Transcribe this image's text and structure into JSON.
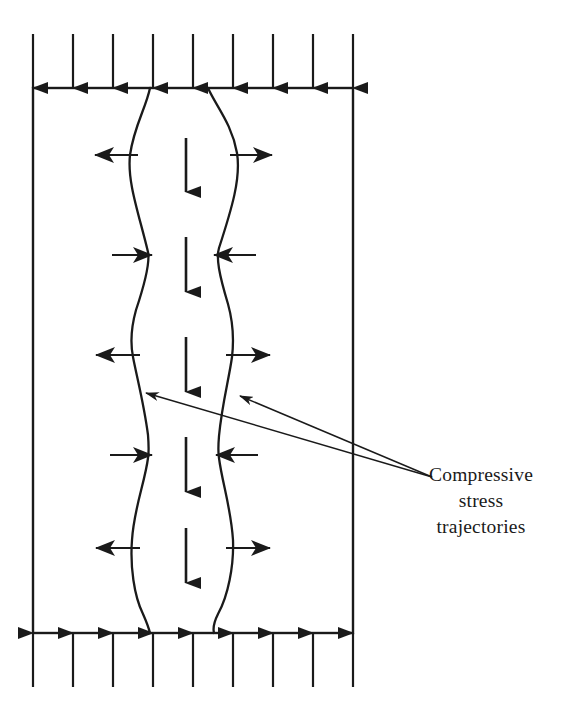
{
  "figure": {
    "background_color": "#ffffff",
    "line_color": "#1a1a1a",
    "text_color": "#1a1a1a"
  },
  "annotation": {
    "label": "Compressive\nstress\ntrajectories",
    "line1": "Compressive",
    "line2": "stress",
    "line3": "trajectories",
    "leader_count": 2
  },
  "specimen": {
    "name": "rectangular-specimen",
    "left": 33,
    "right": 353,
    "top": 88,
    "bottom": 633,
    "stroke_width": 2.4
  },
  "loads": {
    "top": {
      "name": "top-compressive-load",
      "direction": "down",
      "count": 9,
      "x_positions": [
        33,
        73,
        113,
        153,
        193,
        233,
        273,
        313,
        353
      ],
      "tail_y": 34,
      "head_y": 88
    },
    "bottom": {
      "name": "bottom-reaction-load",
      "direction": "up",
      "count": 9,
      "x_positions": [
        33,
        73,
        113,
        153,
        193,
        233,
        273,
        313,
        353
      ],
      "tail_y": 687,
      "head_y": 633
    }
  },
  "center_arrows": {
    "name": "axial-compression-arrows",
    "direction": "down",
    "count": 5,
    "x": 186,
    "items": [
      {
        "tail_y": 138,
        "head_y": 192
      },
      {
        "tail_y": 237,
        "head_y": 292
      },
      {
        "tail_y": 337,
        "head_y": 392
      },
      {
        "tail_y": 437,
        "head_y": 492
      },
      {
        "tail_y": 528,
        "head_y": 583
      }
    ]
  },
  "lateral_arrows": {
    "name": "lateral-stress-arrows",
    "rows": [
      {
        "y": 155,
        "sense": "outward",
        "left_tip": 95,
        "left_tail": 138,
        "right_tail": 230,
        "right_tip": 272
      },
      {
        "y": 255,
        "sense": "inward",
        "left_tip": 152,
        "left_tail": 112,
        "right_tail": 256,
        "right_tip": 214
      },
      {
        "y": 355,
        "sense": "outward",
        "left_tip": 96,
        "left_tail": 140,
        "right_tail": 226,
        "right_tip": 270
      },
      {
        "y": 455,
        "sense": "inward",
        "left_tip": 152,
        "left_tail": 110,
        "right_tail": 258,
        "right_tip": 216
      },
      {
        "y": 548,
        "sense": "outward",
        "left_tip": 96,
        "left_tail": 140,
        "right_tail": 226,
        "right_tip": 270
      }
    ]
  },
  "trajectories": {
    "left": {
      "name": "left-stress-trajectory",
      "path": "M 150,88 C 146,108 134,126 130,155 C 127,182 139,214 148,252 C 150,262 146,280 136,310 C 131,328 130,342 133,357 C 137,378 144,404 148,435 C 149,448 149,452 148,458 C 145,482 134,508 132,540 C 130,566 134,596 143,614 C 147,623 149,629 150,633"
    },
    "right": {
      "name": "right-stress-trajectory",
      "path": "M 208,88 C 216,106 232,124 237,153 C 241,178 232,208 219,248 C 216,258 219,274 228,304 C 233,322 234,340 232,357 C 229,379 222,404 219,436 C 218,448 218,452 219,458 C 222,482 231,508 233,540 C 234,566 228,596 218,614 C 214,622 213,629 214,633"
    }
  },
  "leader_lines": [
    {
      "name": "leader-line-left",
      "from_x": 432,
      "from_y": 477,
      "to_x": 146,
      "to_y": 393
    },
    {
      "name": "leader-line-right",
      "from_x": 432,
      "from_y": 477,
      "to_x": 240,
      "to_y": 396
    }
  ]
}
